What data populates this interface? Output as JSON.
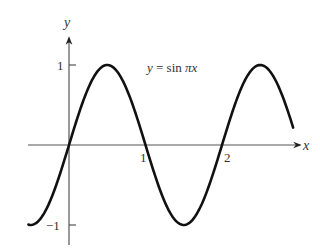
{
  "chart_data": {
    "type": "line",
    "title": "y = sin πx",
    "equation_label": {
      "lhs": "y",
      "eq": " = sin ",
      "pi": "π",
      "var": "x"
    },
    "xlabel": "x",
    "ylabel": "y",
    "x_ticks": [
      {
        "value": 1,
        "label": "1"
      },
      {
        "value": 2,
        "label": "2"
      }
    ],
    "y_ticks": [
      {
        "value": 1,
        "label": "1"
      },
      {
        "value": -1,
        "label": "−1"
      }
    ],
    "xlim": [
      -0.53,
      2.93
    ],
    "ylim": [
      -1,
      1
    ],
    "grid": false,
    "series": [
      {
        "name": "sin(πx)",
        "function": "sin(pi*x)",
        "x_start": -0.53,
        "x_end": 2.93,
        "key_points": [
          [
            -0.5,
            -1
          ],
          [
            0,
            0
          ],
          [
            0.5,
            1
          ],
          [
            1,
            0
          ],
          [
            1.5,
            -1
          ],
          [
            2,
            0
          ],
          [
            2.5,
            1
          ]
        ]
      }
    ]
  },
  "colors": {
    "curve": "#111111",
    "axis": "#555555",
    "text": "#333333"
  }
}
